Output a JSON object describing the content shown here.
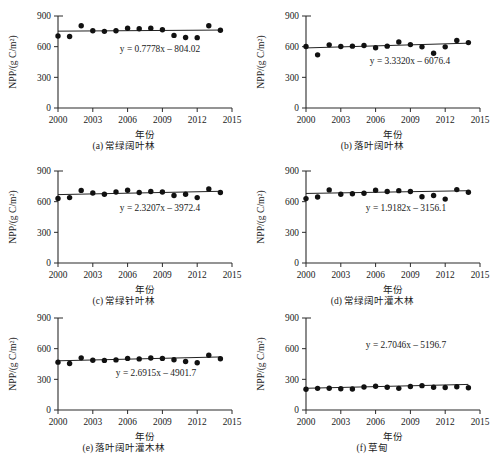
{
  "figure": {
    "axis_x_title": "年份",
    "axis_y_title": "NPP/(g C/m²)",
    "x_ticks": [
      "2000",
      "2003",
      "2006",
      "2009",
      "2012",
      "2015"
    ],
    "y_ticks": [
      "0",
      "300",
      "600",
      "900"
    ],
    "xlim": [
      2000,
      2015
    ],
    "ylim": [
      0,
      900
    ]
  },
  "chart_data": [
    {
      "type": "scatter",
      "id": "a",
      "title": "(a) 常绿阔叶林",
      "xlabel": "年份",
      "ylabel": "NPP/(g C/m²)",
      "xlim": [
        2000,
        2015
      ],
      "ylim": [
        0,
        900
      ],
      "xticks": [
        2000,
        2003,
        2006,
        2009,
        2012,
        2015
      ],
      "yticks": [
        0,
        300,
        600,
        900
      ],
      "grid": false,
      "equation": "y = 0.7778x – 804.02",
      "slope": 0.7778,
      "intercept": -804.02,
      "x": [
        2000,
        2001,
        2002,
        2003,
        2004,
        2005,
        2006,
        2007,
        2008,
        2009,
        2010,
        2011,
        2012,
        2013,
        2014
      ],
      "values": [
        705,
        700,
        805,
        755,
        750,
        755,
        780,
        775,
        780,
        765,
        710,
        690,
        688,
        805,
        760
      ]
    },
    {
      "type": "scatter",
      "id": "b",
      "title": "(b) 落叶阔叶林",
      "xlabel": "年份",
      "ylabel": "NPP/(g C/m²)",
      "xlim": [
        2000,
        2015
      ],
      "ylim": [
        0,
        900
      ],
      "xticks": [
        2000,
        2003,
        2006,
        2009,
        2012,
        2015
      ],
      "yticks": [
        0,
        300,
        600,
        900
      ],
      "grid": false,
      "equation": "y = 3.3320x – 6076.4",
      "slope": 3.332,
      "intercept": -6076.4,
      "x": [
        2000,
        2001,
        2002,
        2003,
        2004,
        2005,
        2006,
        2007,
        2008,
        2009,
        2010,
        2011,
        2012,
        2013,
        2014
      ],
      "values": [
        602,
        520,
        618,
        602,
        605,
        612,
        590,
        605,
        645,
        620,
        598,
        535,
        598,
        660,
        640
      ]
    },
    {
      "type": "scatter",
      "id": "c",
      "title": "(c) 常绿针叶林",
      "xlabel": "年份",
      "ylabel": "NPP/(g C/m²)",
      "xlim": [
        2000,
        2015
      ],
      "ylim": [
        0,
        900
      ],
      "xticks": [
        2000,
        2003,
        2006,
        2009,
        2012,
        2015
      ],
      "yticks": [
        0,
        300,
        600,
        900
      ],
      "grid": false,
      "equation": "y = 2.3207x – 3972.4",
      "slope": 2.3207,
      "intercept": -3972.4,
      "x": [
        2000,
        2001,
        2002,
        2003,
        2004,
        2005,
        2006,
        2007,
        2008,
        2009,
        2010,
        2011,
        2012,
        2013,
        2014
      ],
      "values": [
        632,
        640,
        710,
        685,
        672,
        695,
        712,
        690,
        700,
        695,
        660,
        672,
        640,
        725,
        690
      ]
    },
    {
      "type": "scatter",
      "id": "d",
      "title": "(d) 常绿阔叶灌木林",
      "xlabel": "年份",
      "ylabel": "NPP/(g C/m²)",
      "xlim": [
        2000,
        2015
      ],
      "ylim": [
        0,
        900
      ],
      "xticks": [
        2000,
        2003,
        2006,
        2009,
        2012,
        2015
      ],
      "yticks": [
        0,
        300,
        600,
        900
      ],
      "grid": false,
      "equation": "y = 1.9182x – 3156.1",
      "slope": 1.9182,
      "intercept": -3156.1,
      "x": [
        2000,
        2001,
        2002,
        2003,
        2004,
        2005,
        2006,
        2007,
        2008,
        2009,
        2010,
        2011,
        2012,
        2013,
        2014
      ],
      "values": [
        630,
        645,
        715,
        672,
        678,
        682,
        712,
        700,
        708,
        700,
        648,
        660,
        625,
        718,
        692
      ]
    },
    {
      "type": "scatter",
      "id": "e",
      "title": "(e) 落叶阔叶灌木林",
      "xlabel": "年份",
      "ylabel": "NPP/(g C/m²)",
      "xlim": [
        2000,
        2015
      ],
      "ylim": [
        0,
        900
      ],
      "xticks": [
        2000,
        2003,
        2006,
        2009,
        2012,
        2015
      ],
      "yticks": [
        0,
        300,
        600,
        900
      ],
      "grid": false,
      "equation": "y = 2.6915x – 4901.7",
      "slope": 2.6915,
      "intercept": -4901.7,
      "x": [
        2000,
        2001,
        2002,
        2003,
        2004,
        2005,
        2006,
        2007,
        2008,
        2009,
        2010,
        2011,
        2012,
        2013,
        2014
      ],
      "values": [
        468,
        455,
        510,
        487,
        485,
        490,
        505,
        500,
        508,
        505,
        492,
        475,
        462,
        535,
        502
      ]
    },
    {
      "type": "scatter",
      "id": "f",
      "title": "(f) 草甸",
      "xlabel": "年份",
      "ylabel": "NPP/(g C/m²)",
      "xlim": [
        2000,
        2015
      ],
      "ylim": [
        0,
        900
      ],
      "xticks": [
        2000,
        2003,
        2006,
        2009,
        2012,
        2015
      ],
      "yticks": [
        0,
        300,
        600,
        900
      ],
      "grid": false,
      "equation": "y = 2.7046x – 5196.7",
      "slope": 2.7046,
      "intercept": -5196.7,
      "x": [
        2000,
        2001,
        2002,
        2003,
        2004,
        2005,
        2006,
        2007,
        2008,
        2009,
        2010,
        2011,
        2012,
        2013,
        2014
      ],
      "values": [
        203,
        212,
        213,
        208,
        205,
        225,
        232,
        222,
        212,
        230,
        238,
        222,
        220,
        228,
        218
      ]
    }
  ]
}
